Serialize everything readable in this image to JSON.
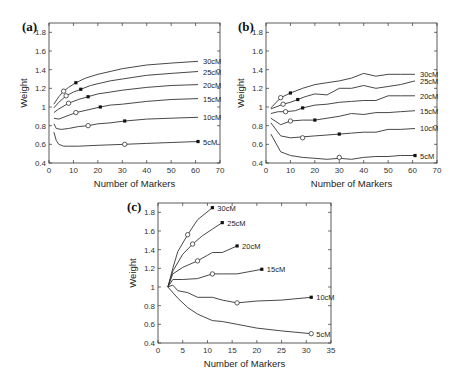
{
  "chart_data": [
    {
      "panel": "(a)",
      "type": "line",
      "title": "",
      "xlabel": "Number of Markers",
      "ylabel": "Weight",
      "xlim": [
        0,
        70
      ],
      "ylim": [
        0.4,
        1.9
      ],
      "xticks": [
        0,
        10,
        20,
        30,
        40,
        50,
        60,
        70
      ],
      "yticks": [
        0.4,
        0.6,
        0.8,
        1,
        1.2,
        1.4,
        1.6,
        1.8
      ],
      "grid": false,
      "series": [
        {
          "name": "30cM",
          "x": [
            2,
            4,
            6,
            8,
            11,
            15,
            20,
            25,
            30,
            40,
            50,
            61
          ],
          "y": [
            1.03,
            1.11,
            1.17,
            1.21,
            1.26,
            1.31,
            1.35,
            1.38,
            1.41,
            1.45,
            1.47,
            1.49
          ],
          "open_marker": [
            6,
            1.17
          ],
          "filled_marker": [
            11,
            1.26
          ]
        },
        {
          "name": "25cM",
          "x": [
            2,
            4,
            7,
            10,
            13,
            17,
            20,
            25,
            30,
            40,
            50,
            61
          ],
          "y": [
            0.99,
            1.05,
            1.12,
            1.16,
            1.19,
            1.23,
            1.25,
            1.28,
            1.3,
            1.34,
            1.36,
            1.38
          ],
          "open_marker": [
            7,
            1.12
          ],
          "filled_marker": [
            13,
            1.19
          ]
        },
        {
          "name": "20cM",
          "x": [
            2,
            4,
            8,
            12,
            16,
            20,
            25,
            30,
            40,
            50,
            61
          ],
          "y": [
            0.94,
            0.98,
            1.04,
            1.08,
            1.11,
            1.14,
            1.16,
            1.18,
            1.21,
            1.23,
            1.24
          ],
          "open_marker": [
            8,
            1.04
          ],
          "filled_marker": [
            16,
            1.11
          ]
        },
        {
          "name": "15cM",
          "x": [
            2,
            4,
            7,
            11,
            16,
            21,
            25,
            30,
            40,
            50,
            61
          ],
          "y": [
            0.88,
            0.87,
            0.9,
            0.94,
            0.97,
            1.0,
            1.02,
            1.03,
            1.06,
            1.08,
            1.09
          ],
          "open_marker": [
            11,
            0.94
          ],
          "filled_marker": [
            21,
            1.0
          ]
        },
        {
          "name": "10cM",
          "x": [
            2,
            3,
            5,
            8,
            12,
            16,
            20,
            25,
            31,
            40,
            50,
            61
          ],
          "y": [
            0.82,
            0.77,
            0.76,
            0.77,
            0.79,
            0.8,
            0.82,
            0.83,
            0.85,
            0.87,
            0.88,
            0.89
          ],
          "open_marker": [
            16,
            0.8
          ],
          "filled_marker": [
            31,
            0.85
          ]
        },
        {
          "name": "5cM",
          "x": [
            2,
            3,
            4,
            6,
            8,
            12,
            20,
            31,
            40,
            50,
            61
          ],
          "y": [
            0.73,
            0.64,
            0.6,
            0.58,
            0.58,
            0.58,
            0.59,
            0.6,
            0.61,
            0.62,
            0.63
          ],
          "open_marker": [
            31,
            0.6
          ],
          "filled_marker": [
            61,
            0.63
          ]
        }
      ]
    },
    {
      "panel": "(b)",
      "type": "line",
      "title": "",
      "xlabel": "Number of Markers",
      "ylabel": "Weight",
      "xlim": [
        0,
        70
      ],
      "ylim": [
        0.4,
        1.9
      ],
      "xticks": [
        0,
        10,
        20,
        30,
        40,
        50,
        60,
        70
      ],
      "yticks": [
        0.4,
        0.6,
        0.8,
        1,
        1.2,
        1.4,
        1.6,
        1.8
      ],
      "grid": false,
      "series": [
        {
          "name": "30cM",
          "x": [
            2,
            6,
            10,
            15,
            20,
            25,
            30,
            35,
            40,
            45,
            50,
            55,
            61
          ],
          "y": [
            0.99,
            1.1,
            1.15,
            1.2,
            1.24,
            1.26,
            1.28,
            1.31,
            1.36,
            1.33,
            1.35,
            1.35,
            1.35
          ],
          "open_marker": [
            6,
            1.1
          ],
          "filled_marker": [
            10,
            1.15
          ]
        },
        {
          "name": "25cM",
          "x": [
            2,
            7,
            10,
            13,
            16,
            20,
            25,
            30,
            35,
            40,
            45,
            50,
            55,
            61
          ],
          "y": [
            0.98,
            1.03,
            1.05,
            1.08,
            1.11,
            1.14,
            1.13,
            1.2,
            1.2,
            1.23,
            1.2,
            1.22,
            1.24,
            1.28
          ],
          "open_marker": [
            7,
            1.03
          ],
          "filled_marker": [
            13,
            1.08
          ]
        },
        {
          "name": "20cM",
          "x": [
            2,
            5,
            8,
            12,
            15,
            20,
            25,
            30,
            35,
            40,
            45,
            50,
            55,
            61
          ],
          "y": [
            0.93,
            0.95,
            0.95,
            0.96,
            0.99,
            1.02,
            1.03,
            1.05,
            1.06,
            1.07,
            1.07,
            1.12,
            1.12,
            1.12
          ],
          "open_marker": [
            8,
            0.95
          ],
          "filled_marker": [
            15,
            0.99
          ]
        },
        {
          "name": "15cM",
          "x": [
            2,
            6,
            10,
            15,
            20,
            25,
            30,
            35,
            40,
            45,
            50,
            55,
            61
          ],
          "y": [
            0.88,
            0.81,
            0.85,
            0.86,
            0.86,
            0.88,
            0.9,
            0.93,
            0.92,
            0.94,
            0.94,
            0.95,
            0.96
          ],
          "open_marker": [
            10,
            0.85
          ],
          "filled_marker": [
            20,
            0.86
          ]
        },
        {
          "name": "10cM",
          "x": [
            2,
            6,
            10,
            15,
            20,
            25,
            30,
            35,
            40,
            45,
            50,
            55,
            61
          ],
          "y": [
            0.83,
            0.69,
            0.67,
            0.68,
            0.69,
            0.7,
            0.71,
            0.72,
            0.73,
            0.73,
            0.76,
            0.76,
            0.77
          ],
          "open_marker": [
            15,
            0.67
          ],
          "filled_marker": [
            30,
            0.71
          ]
        },
        {
          "name": "5cM",
          "x": [
            2,
            6,
            10,
            15,
            20,
            25,
            30,
            35,
            40,
            45,
            50,
            55,
            61
          ],
          "y": [
            0.71,
            0.52,
            0.48,
            0.46,
            0.45,
            0.44,
            0.45,
            0.44,
            0.46,
            0.47,
            0.47,
            0.48,
            0.48
          ],
          "open_marker": [
            30,
            0.46
          ],
          "filled_marker": [
            61,
            0.48
          ]
        }
      ]
    },
    {
      "panel": "(c)",
      "type": "line",
      "title": "",
      "xlabel": "Number of Markers",
      "ylabel": "Weight",
      "xlim": [
        0,
        35
      ],
      "ylim": [
        0.4,
        1.9
      ],
      "xticks": [
        0,
        5,
        10,
        15,
        20,
        25,
        30,
        35
      ],
      "yticks": [
        0.4,
        0.6,
        0.8,
        1,
        1.2,
        1.4,
        1.6,
        1.8
      ],
      "grid": false,
      "series": [
        {
          "name": "30cM",
          "x": [
            2,
            3,
            4,
            6,
            8,
            11
          ],
          "y": [
            1.0,
            1.2,
            1.38,
            1.56,
            1.72,
            1.85
          ],
          "open_marker": [
            6,
            1.56
          ],
          "filled_marker": [
            11,
            1.85
          ]
        },
        {
          "name": "25cM",
          "x": [
            2,
            3,
            5,
            7,
            9,
            11,
            13
          ],
          "y": [
            1.0,
            1.17,
            1.35,
            1.46,
            1.55,
            1.62,
            1.69
          ],
          "open_marker": [
            7,
            1.46
          ],
          "filled_marker": [
            13,
            1.69
          ]
        },
        {
          "name": "20cM",
          "x": [
            2,
            3,
            5,
            8,
            10,
            11,
            13,
            16
          ],
          "y": [
            1.0,
            1.14,
            1.21,
            1.28,
            1.34,
            1.37,
            1.37,
            1.44
          ],
          "open_marker": [
            8,
            1.28
          ],
          "filled_marker": [
            16,
            1.44
          ]
        },
        {
          "name": "15cM",
          "x": [
            2,
            3,
            5,
            8,
            11,
            13,
            16,
            21
          ],
          "y": [
            1.0,
            1.08,
            1.08,
            1.09,
            1.14,
            1.14,
            1.14,
            1.19
          ],
          "open_marker": [
            11,
            1.14
          ],
          "filled_marker": [
            21,
            1.19
          ]
        },
        {
          "name": "10cM",
          "x": [
            2,
            3,
            4,
            6,
            8,
            11,
            13,
            16,
            20,
            25,
            31
          ],
          "y": [
            1.0,
            1.02,
            0.96,
            0.94,
            0.89,
            0.89,
            0.86,
            0.83,
            0.85,
            0.86,
            0.89
          ],
          "open_marker": [
            16,
            0.83
          ],
          "filled_marker": [
            31,
            0.89
          ]
        },
        {
          "name": "5cM",
          "x": [
            2,
            4,
            6,
            8,
            11,
            13,
            16,
            20,
            25,
            31
          ],
          "y": [
            1.0,
            0.88,
            0.78,
            0.71,
            0.64,
            0.63,
            0.6,
            0.56,
            0.53,
            0.5
          ],
          "open_marker": [
            31,
            0.5
          ],
          "filled_marker": null
        }
      ]
    }
  ],
  "panels": {
    "a": {
      "label": "(a)",
      "xlabel": "Number of Markers",
      "ylabel": "Weight"
    },
    "b": {
      "label": "(b)",
      "xlabel": "Number of Markers",
      "ylabel": "Weight"
    },
    "c": {
      "label": "(c)",
      "xlabel": "Number of Markers",
      "ylabel": "Weight"
    }
  },
  "style": {
    "line_color": "#333333",
    "background": "#ffffff"
  }
}
